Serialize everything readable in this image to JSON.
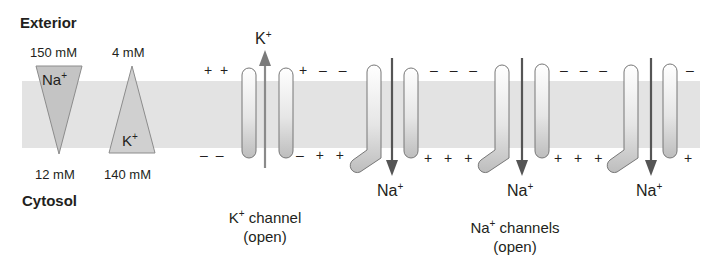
{
  "labels": {
    "exterior": "Exterior",
    "cytosol": "Cytosol"
  },
  "gradients": {
    "na": {
      "ion": "Na",
      "charge": "+",
      "exterior_conc": "150 mM",
      "cytosol_conc": "12 mM"
    },
    "k": {
      "ion": "K",
      "charge": "+",
      "exterior_conc": "4 mM",
      "cytosol_conc": "140 mM"
    }
  },
  "k_channel": {
    "ion": "K",
    "charge": "+",
    "title": "channel",
    "state": "(open)",
    "exterior_charges": "+ +",
    "cytosol_charges": "– –",
    "right_exterior_charges": "+ – –",
    "right_cytosol_charges": "– + +"
  },
  "na_channels": {
    "ion": "Na",
    "charge": "+",
    "title": "channels",
    "state": "(open)",
    "items": [
      {
        "ion_label": "Na",
        "exterior_charges_after": "– – –",
        "cytosol_charges_after": "+ + +"
      },
      {
        "ion_label": "Na",
        "exterior_charges_after": "– – –",
        "cytosol_charges_after": "+ + +"
      },
      {
        "ion_label": "Na",
        "exterior_charges_after": "–",
        "cytosol_charges_after": "+"
      }
    ]
  },
  "colors": {
    "membrane": "#e3e3e3",
    "triangle": "#c9c9c9",
    "arrow": "#555555",
    "outline": "#777777"
  }
}
